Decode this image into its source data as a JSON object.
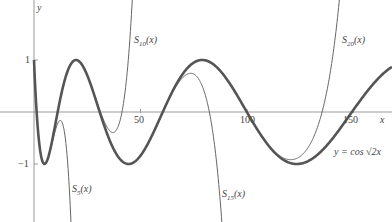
{
  "chart_data": {
    "type": "line",
    "title": "",
    "xlabel": "x",
    "ylabel": "y",
    "xlim": [
      0,
      165
    ],
    "ylim": [
      -2,
      2
    ],
    "x_ticks": [
      "50",
      "100",
      "150"
    ],
    "y_ticks": [
      "1",
      "-1"
    ],
    "grid": false,
    "legend": "inline labels",
    "series": [
      {
        "name": "y = cos √(2x)",
        "style": "thick",
        "function": "cos(sqrt(2x))"
      },
      {
        "name": "S5(x)",
        "style": "thin",
        "note": "Taylor partial sum, diverges near x≈15"
      },
      {
        "name": "S10(x)",
        "style": "thin",
        "note": "diverges upward near x≈48"
      },
      {
        "name": "S15(x)",
        "style": "thin",
        "note": "diverges downward near x≈90"
      },
      {
        "name": "S20(x)",
        "style": "thin",
        "note": "diverges upward near x≈145"
      }
    ]
  },
  "labels": {
    "y_axis": "y",
    "x_axis": "x",
    "tick_1": "1",
    "tick_m1": "−1",
    "tick_50": "50",
    "tick_100": "100",
    "tick_150": "150",
    "s5": "S",
    "s5_sub": "5",
    "s10": "S",
    "s10_sub": "10",
    "s15": "S",
    "s15_sub": "15",
    "s20": "S",
    "s20_sub": "20",
    "arg": "(x)",
    "func": "y = cos √2x"
  }
}
